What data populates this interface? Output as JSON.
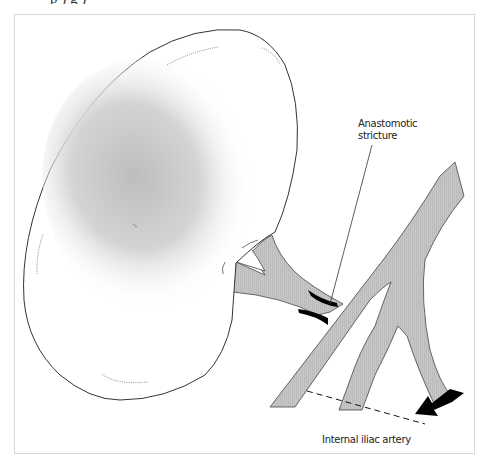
{
  "caption": {
    "text_cut_off": "p                                   )           g      )"
  },
  "diagram": {
    "colors": {
      "vessel_fill": "#c4c4c4",
      "outline": "#333333",
      "stricture": "#000000",
      "frame_border": "#d8d8d8"
    },
    "labels": {
      "stricture_line1": "Anastomotic",
      "stricture_line2": "stricture",
      "iliac": "Internal iliac artery"
    },
    "annotations": {
      "arrow": "flow-direction-arrow",
      "dashed_line": "ligation-line"
    }
  }
}
